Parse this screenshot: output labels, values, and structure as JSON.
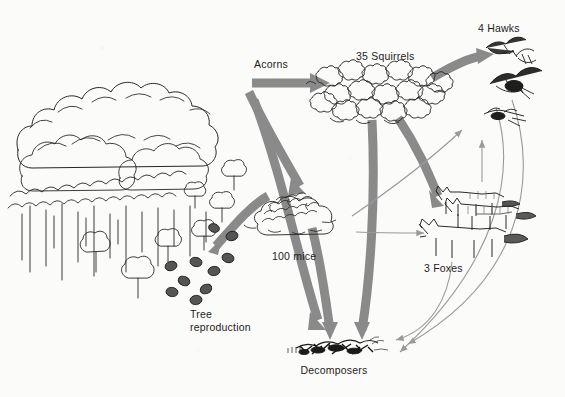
{
  "diagram": {
    "background_color": "#fbfbfa",
    "ink_color": "#1d1d1d",
    "thick_arrow_color": "#8a8a8a",
    "thin_arrow_color": "#9a9a9a",
    "labels": {
      "acorns": "Acorns",
      "squirrels": "35 Squirrels",
      "hawks": "4 Hawks",
      "mice": "100 mice",
      "foxes": "3 Foxes",
      "tree_reproduction": "Tree\nreproduction",
      "decomposers": "Decomposers"
    },
    "organisms": [
      {
        "name": "oak-forest",
        "label": "",
        "count": null
      },
      {
        "name": "squirrels",
        "label": "35 Squirrels",
        "count": 35
      },
      {
        "name": "mice",
        "label": "100 mice",
        "count": 100
      },
      {
        "name": "hawks",
        "label": "4 Hawks",
        "count": 4
      },
      {
        "name": "foxes",
        "label": "3 Foxes",
        "count": 3
      },
      {
        "name": "decomposers",
        "label": "Decomposers",
        "count": null
      },
      {
        "name": "tree-reproduction",
        "label": "Tree reproduction",
        "count": null
      }
    ],
    "flows": [
      {
        "from": "oak-forest",
        "to": "squirrels",
        "style": "thick"
      },
      {
        "from": "oak-forest",
        "to": "mice",
        "style": "thick"
      },
      {
        "from": "oak-forest",
        "to": "decomposers",
        "style": "thick"
      },
      {
        "from": "mice",
        "to": "tree-reproduction",
        "style": "thick"
      },
      {
        "from": "squirrels",
        "to": "hawks",
        "style": "thick"
      },
      {
        "from": "squirrels",
        "to": "foxes",
        "style": "thick"
      },
      {
        "from": "squirrels",
        "to": "decomposers",
        "style": "thick"
      },
      {
        "from": "mice",
        "to": "decomposers",
        "style": "thick"
      },
      {
        "from": "mice",
        "to": "hawks",
        "style": "thin"
      },
      {
        "from": "mice",
        "to": "foxes",
        "style": "thin"
      },
      {
        "from": "hawks",
        "to": "decomposers",
        "style": "thin"
      },
      {
        "from": "foxes",
        "to": "decomposers",
        "style": "thin"
      }
    ]
  }
}
